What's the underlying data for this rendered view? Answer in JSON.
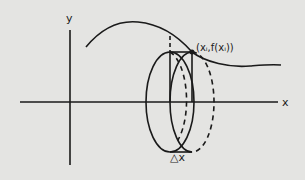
{
  "diagram": {
    "background_color": "#e4e4e2",
    "stroke_color": "#1a1a1a",
    "labels": {
      "y_axis": "y",
      "x_axis": "x",
      "point": "(xᵢ,f(xᵢ))",
      "delta_x": "△x"
    },
    "elements": [
      {
        "id": "y-axis",
        "type": "line",
        "style": "solid"
      },
      {
        "id": "x-axis",
        "type": "line",
        "style": "solid"
      },
      {
        "id": "curve-f",
        "type": "curve",
        "style": "solid",
        "description": "graph of f(x), rising to a max then decaying"
      },
      {
        "id": "point-xi",
        "type": "point",
        "label": "(xᵢ,f(xᵢ))"
      },
      {
        "id": "disk-left-face",
        "type": "ellipse",
        "style": "solid"
      },
      {
        "id": "disk-right-face",
        "type": "ellipse",
        "style": "dashed"
      },
      {
        "id": "rectangle-slice",
        "type": "rectangle",
        "style": "solid",
        "width_label": "△x"
      }
    ]
  }
}
